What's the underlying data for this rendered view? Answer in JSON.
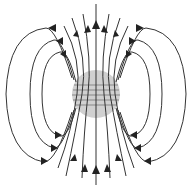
{
  "diagram": {
    "elements": {
      "sphere": "magnetized sphere (shaded, with grid of field lines passing through)",
      "field_lines": "dipole field lines emerging from top and returning at bottom",
      "arrows": "direction arrows pointing upward along field lines"
    },
    "colors": {
      "sphere_fill": "#d0d0d0",
      "line": "#333333",
      "arrow": "#222222"
    }
  }
}
